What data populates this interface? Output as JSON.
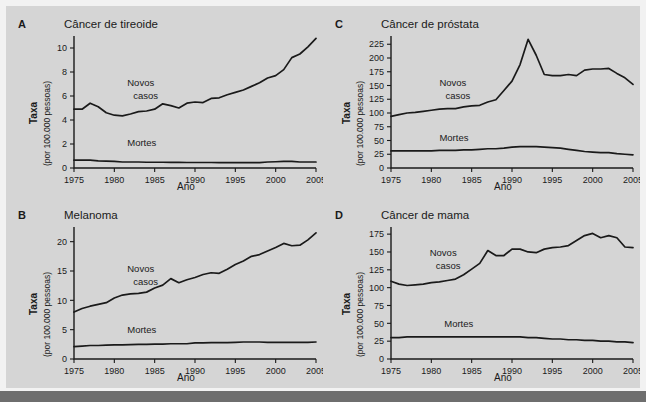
{
  "figure": {
    "background_color": "#d5d5d5",
    "page_color": "#f2f2f2",
    "rule_color": "#6e6e6e",
    "line_color": "#1a1a1a"
  },
  "axis_titles": {
    "y_main": "Taxa",
    "y_sub": "(por 100.000 pessoas)",
    "x": "Ano"
  },
  "series_labels": {
    "new_cases_line1": "Novos",
    "new_cases_line2": "casos",
    "deaths": "Mortes"
  },
  "panels": {
    "a": {
      "letter": "A",
      "title": "Câncer de tireoide"
    },
    "b": {
      "letter": "B",
      "title": "Melanoma"
    },
    "c": {
      "letter": "C",
      "title": "Câncer de próstata"
    },
    "d": {
      "letter": "D",
      "title": "Câncer de mama"
    }
  },
  "chart_data": [
    {
      "id": "a",
      "type": "line",
      "title": "Câncer de tireoide",
      "panel_letter": "A",
      "xlabel": "Ano",
      "ylabel": "Taxa (por 100.000 pessoas)",
      "xlim": [
        1975,
        2005
      ],
      "ylim": [
        0,
        11
      ],
      "xticks": [
        1975,
        1980,
        1985,
        1990,
        1995,
        2000,
        2005
      ],
      "yticks": [
        0,
        2,
        4,
        6,
        8,
        10
      ],
      "grid": false,
      "legend_position": "inline-annotation",
      "x": [
        1975,
        1976,
        1977,
        1978,
        1979,
        1980,
        1981,
        1982,
        1983,
        1984,
        1985,
        1986,
        1987,
        1988,
        1989,
        1990,
        1991,
        1992,
        1993,
        1994,
        1995,
        1996,
        1997,
        1998,
        1999,
        2000,
        2001,
        2002,
        2003,
        2004,
        2005
      ],
      "series": [
        {
          "name": "Novos casos",
          "values": [
            4.9,
            4.9,
            5.4,
            5.1,
            4.6,
            4.4,
            4.35,
            4.5,
            4.7,
            4.75,
            4.9,
            5.35,
            5.2,
            5.0,
            5.4,
            5.5,
            5.45,
            5.8,
            5.85,
            6.1,
            6.3,
            6.5,
            6.8,
            7.1,
            7.5,
            7.7,
            8.2,
            9.2,
            9.5,
            10.1,
            10.8
          ]
        },
        {
          "name": "Mortes",
          "values": [
            0.65,
            0.65,
            0.65,
            0.6,
            0.58,
            0.55,
            0.5,
            0.5,
            0.5,
            0.48,
            0.48,
            0.48,
            0.47,
            0.47,
            0.46,
            0.46,
            0.46,
            0.46,
            0.45,
            0.45,
            0.45,
            0.45,
            0.45,
            0.45,
            0.5,
            0.52,
            0.55,
            0.55,
            0.5,
            0.5,
            0.5
          ]
        }
      ]
    },
    {
      "id": "b",
      "type": "line",
      "title": "Melanoma",
      "panel_letter": "B",
      "xlabel": "Ano",
      "ylabel": "Taxa (por 100.000 pessoas)",
      "xlim": [
        1975,
        2005
      ],
      "ylim": [
        0,
        22.5
      ],
      "xticks": [
        1975,
        1980,
        1985,
        1990,
        1995,
        2000,
        2005
      ],
      "yticks": [
        0,
        5,
        10,
        15,
        20
      ],
      "grid": false,
      "legend_position": "inline-annotation",
      "x": [
        1975,
        1976,
        1977,
        1978,
        1979,
        1980,
        1981,
        1982,
        1983,
        1984,
        1985,
        1986,
        1987,
        1988,
        1989,
        1990,
        1991,
        1992,
        1993,
        1994,
        1995,
        1996,
        1997,
        1998,
        1999,
        2000,
        2001,
        2002,
        2003,
        2004,
        2005
      ],
      "series": [
        {
          "name": "Novos casos",
          "values": [
            8.0,
            8.6,
            9.0,
            9.3,
            9.6,
            10.4,
            10.9,
            11.1,
            11.2,
            11.4,
            12.1,
            12.6,
            13.7,
            13.0,
            13.5,
            13.9,
            14.4,
            14.7,
            14.6,
            15.3,
            16.1,
            16.7,
            17.5,
            17.8,
            18.4,
            19.0,
            19.7,
            19.3,
            19.4,
            20.3,
            21.5
          ]
        },
        {
          "name": "Mortes",
          "values": [
            2.1,
            2.2,
            2.3,
            2.3,
            2.35,
            2.4,
            2.4,
            2.45,
            2.5,
            2.5,
            2.55,
            2.55,
            2.6,
            2.6,
            2.6,
            2.75,
            2.75,
            2.8,
            2.8,
            2.8,
            2.85,
            2.9,
            2.9,
            2.9,
            2.85,
            2.85,
            2.85,
            2.85,
            2.85,
            2.85,
            2.9
          ]
        }
      ]
    },
    {
      "id": "c",
      "type": "line",
      "title": "Câncer de próstata",
      "panel_letter": "C",
      "xlabel": "Ano",
      "ylabel": "Taxa (por 100.000 pessoas)",
      "xlim": [
        1975,
        2005
      ],
      "ylim": [
        0,
        240
      ],
      "xticks": [
        1975,
        1980,
        1985,
        1990,
        1995,
        2000,
        2005
      ],
      "yticks": [
        0,
        25,
        50,
        75,
        100,
        125,
        150,
        175,
        200,
        225
      ],
      "grid": false,
      "legend_position": "inline-annotation",
      "x": [
        1975,
        1976,
        1977,
        1978,
        1979,
        1980,
        1981,
        1982,
        1983,
        1984,
        1985,
        1986,
        1987,
        1988,
        1989,
        1990,
        1991,
        1992,
        1993,
        1994,
        1995,
        1996,
        1997,
        1998,
        1999,
        2000,
        2001,
        2002,
        2003,
        2004,
        2005
      ],
      "series": [
        {
          "name": "Novos casos",
          "values": [
            94,
            97,
            100,
            101,
            103,
            105,
            107,
            108,
            108,
            111,
            113,
            114,
            120,
            124,
            141,
            158,
            188,
            234,
            205,
            170,
            168,
            168,
            170,
            168,
            178,
            180,
            180,
            181,
            172,
            164,
            152
          ]
        },
        {
          "name": "Mortes",
          "values": [
            31,
            31,
            31,
            31,
            31,
            31,
            32,
            32,
            32,
            33,
            33,
            34,
            35,
            35,
            36,
            38,
            39,
            39,
            39,
            38,
            37,
            36,
            34,
            32,
            30,
            29,
            28,
            28,
            26,
            25,
            24
          ]
        }
      ]
    },
    {
      "id": "d",
      "type": "line",
      "title": "Câncer de mama",
      "panel_letter": "D",
      "xlabel": "Ano",
      "ylabel": "Taxa (por 100.000 pessoas)",
      "xlim": [
        1975,
        2005
      ],
      "ylim": [
        0,
        185
      ],
      "xticks": [
        1975,
        1980,
        1985,
        1990,
        1995,
        2000,
        2005
      ],
      "yticks": [
        0,
        25,
        50,
        75,
        100,
        125,
        150,
        175
      ],
      "grid": false,
      "legend_position": "inline-annotation",
      "x": [
        1975,
        1976,
        1977,
        1978,
        1979,
        1980,
        1981,
        1982,
        1983,
        1984,
        1985,
        1986,
        1987,
        1988,
        1989,
        1990,
        1991,
        1992,
        1993,
        1994,
        1995,
        1996,
        1997,
        1998,
        1999,
        2000,
        2001,
        2002,
        2003,
        2004,
        2005
      ],
      "series": [
        {
          "name": "Novos casos",
          "values": [
            109,
            105,
            103,
            104,
            105,
            107,
            108,
            110,
            112,
            118,
            126,
            134,
            152,
            145,
            145,
            154,
            154,
            150,
            149,
            154,
            156,
            157,
            159,
            166,
            173,
            176,
            170,
            173,
            170,
            157,
            156
          ]
        },
        {
          "name": "Mortes",
          "values": [
            30,
            30,
            31,
            31,
            31,
            31,
            31,
            31,
            31,
            31,
            31,
            31,
            31,
            31,
            31,
            31,
            31,
            30,
            30,
            29,
            28,
            28,
            27,
            27,
            26,
            26,
            25,
            25,
            24,
            24,
            23
          ]
        }
      ]
    }
  ]
}
